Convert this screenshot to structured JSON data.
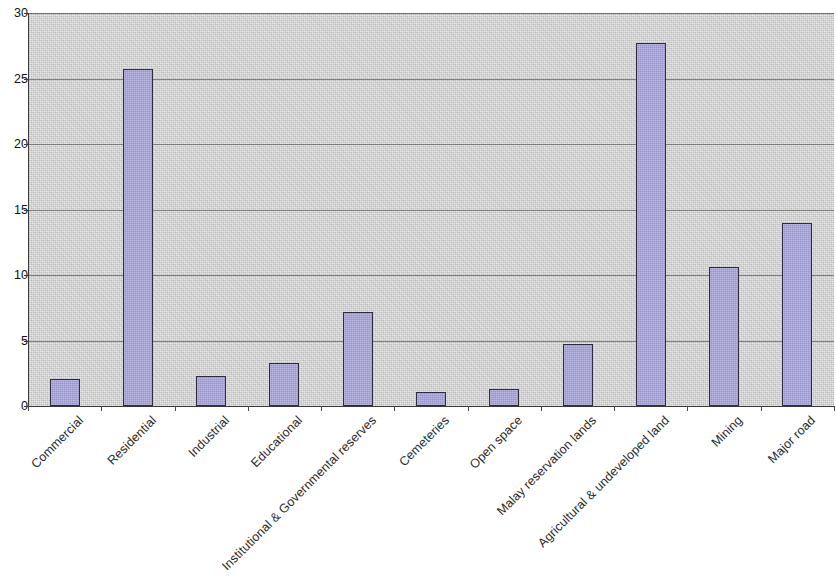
{
  "chart_data": {
    "type": "bar",
    "title": "",
    "xlabel": "",
    "ylabel": "",
    "ylim": [
      0,
      30
    ],
    "yticks": [
      0,
      5,
      10,
      15,
      20,
      25,
      30
    ],
    "grid": true,
    "legend": "none",
    "categories": [
      "Commercial",
      "Residential",
      "Industrial",
      "Educational",
      "Institutional & Governmental reserves",
      "Cemeteries",
      "Open space",
      "Malay reservation lands",
      "Agricultural & undeveloped land",
      "Mining",
      "Major road"
    ],
    "values": [
      2.1,
      25.7,
      2.3,
      3.3,
      7.2,
      1.1,
      1.3,
      4.7,
      27.7,
      10.6,
      14.0
    ],
    "series": [
      {
        "name": "Series 1",
        "values": [
          2.1,
          25.7,
          2.3,
          3.3,
          7.2,
          1.1,
          1.3,
          4.7,
          27.7,
          10.6,
          14.0
        ]
      }
    ]
  },
  "style": {
    "bar_fill": "#a6a2da",
    "bar_border": "#2e2b3f",
    "plot_background": "#cfcfcf",
    "gridline_color": "#6f6f6f",
    "axis_color": "#3a3a3a",
    "page_background": "#ffffff",
    "text_color": "#2a2a2a"
  }
}
